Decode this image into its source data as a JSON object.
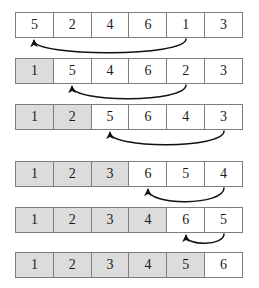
{
  "diagram": {
    "cell_count": 6,
    "row_count": 6,
    "colors": {
      "sorted_fill": "#dcdcdc",
      "unsorted_fill": "#ffffff",
      "border": "#7d7d7d",
      "text": "#1a1a1a",
      "arrow": "#111111"
    },
    "rows": [
      {
        "index": 0,
        "values": [
          "5",
          "2",
          "4",
          "6",
          "1",
          "3"
        ],
        "sorted_prefix": 0,
        "arrow": {
          "from_cell": 5,
          "to_cell": 1,
          "direction": "right-to-left"
        }
      },
      {
        "index": 1,
        "values": [
          "1",
          "5",
          "4",
          "6",
          "2",
          "3"
        ],
        "sorted_prefix": 1,
        "arrow": {
          "from_cell": 5,
          "to_cell": 2,
          "direction": "right-to-left"
        }
      },
      {
        "index": 2,
        "values": [
          "1",
          "2",
          "5",
          "6",
          "4",
          "3"
        ],
        "sorted_prefix": 2,
        "arrow": {
          "from_cell": 6,
          "to_cell": 3,
          "direction": "right-to-left"
        }
      },
      {
        "index": 3,
        "values": [
          "1",
          "2",
          "3",
          "6",
          "5",
          "4"
        ],
        "sorted_prefix": 3,
        "arrow": {
          "from_cell": 6,
          "to_cell": 4,
          "direction": "right-to-left"
        }
      },
      {
        "index": 4,
        "values": [
          "1",
          "2",
          "3",
          "4",
          "6",
          "5"
        ],
        "sorted_prefix": 4,
        "arrow": {
          "from_cell": 6,
          "to_cell": 5,
          "direction": "right-to-left"
        }
      },
      {
        "index": 5,
        "values": [
          "1",
          "2",
          "3",
          "4",
          "5",
          "6"
        ],
        "sorted_prefix": 5,
        "arrow": null
      }
    ]
  }
}
